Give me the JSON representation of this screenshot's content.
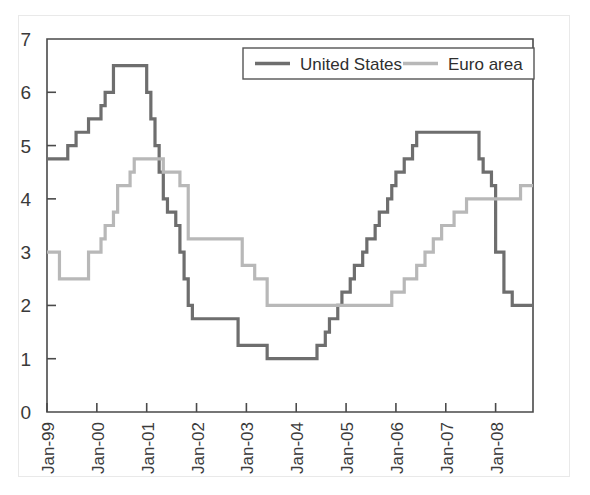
{
  "figure": {
    "title": "",
    "background_color": "#ffffff",
    "frame_color": "#e9e9e9"
  },
  "legend": {
    "position": "top-center-right",
    "entries": [
      {
        "label": "United States",
        "color": "#6e6e6e",
        "swatch_name": "legend-swatch-united-states"
      },
      {
        "label": "Euro area",
        "color": "#b8b8b8",
        "swatch_name": "legend-swatch-euro-area"
      }
    ]
  },
  "axes": {
    "y_ticks": [
      "0",
      "1",
      "2",
      "3",
      "4",
      "5",
      "6",
      "7"
    ],
    "x_ticks": [
      "Jan-99",
      "Jan-00",
      "Jan-01",
      "Jan-02",
      "Jan-03",
      "Jan-04",
      "Jan-05",
      "Jan-06",
      "Jan-07",
      "Jan-08"
    ]
  },
  "chart_data": {
    "type": "line",
    "title": "",
    "subtitle": "",
    "xlabel": "",
    "ylabel": "",
    "xlim": [
      "Jan-99",
      "Oct-08"
    ],
    "ylim": [
      0,
      7
    ],
    "y_ticks": [
      0,
      1,
      2,
      3,
      4,
      5,
      6,
      7
    ],
    "x_tick_labels": [
      "Jan-99",
      "Jan-00",
      "Jan-01",
      "Jan-02",
      "Jan-03",
      "Jan-04",
      "Jan-05",
      "Jan-06",
      "Jan-07",
      "Jan-08"
    ],
    "grid": false,
    "legend_position": "top-center-right",
    "line_style": "step",
    "x_months": [
      "Jan-99",
      "Feb-99",
      "Mar-99",
      "Apr-99",
      "May-99",
      "Jun-99",
      "Jul-99",
      "Aug-99",
      "Sep-99",
      "Oct-99",
      "Nov-99",
      "Dec-99",
      "Jan-00",
      "Feb-00",
      "Mar-00",
      "Apr-00",
      "May-00",
      "Jun-00",
      "Jul-00",
      "Aug-00",
      "Sep-00",
      "Oct-00",
      "Nov-00",
      "Dec-00",
      "Jan-01",
      "Feb-01",
      "Mar-01",
      "Apr-01",
      "May-01",
      "Jun-01",
      "Jul-01",
      "Aug-01",
      "Sep-01",
      "Oct-01",
      "Nov-01",
      "Dec-01",
      "Jan-02",
      "Feb-02",
      "Mar-02",
      "Apr-02",
      "May-02",
      "Jun-02",
      "Jul-02",
      "Aug-02",
      "Sep-02",
      "Oct-02",
      "Nov-02",
      "Dec-02",
      "Jan-03",
      "Feb-03",
      "Mar-03",
      "Apr-03",
      "May-03",
      "Jun-03",
      "Jul-03",
      "Aug-03",
      "Sep-03",
      "Oct-03",
      "Nov-03",
      "Dec-03",
      "Jan-04",
      "Feb-04",
      "Mar-04",
      "Apr-04",
      "May-04",
      "Jun-04",
      "Jul-04",
      "Aug-04",
      "Sep-04",
      "Oct-04",
      "Nov-04",
      "Dec-04",
      "Jan-05",
      "Feb-05",
      "Mar-05",
      "Apr-05",
      "May-05",
      "Jun-05",
      "Jul-05",
      "Aug-05",
      "Sep-05",
      "Oct-05",
      "Nov-05",
      "Dec-05",
      "Jan-06",
      "Feb-06",
      "Mar-06",
      "Apr-06",
      "May-06",
      "Jun-06",
      "Jul-06",
      "Aug-06",
      "Sep-06",
      "Oct-06",
      "Nov-06",
      "Dec-06",
      "Jan-07",
      "Feb-07",
      "Mar-07",
      "Apr-07",
      "May-07",
      "Jun-07",
      "Jul-07",
      "Aug-07",
      "Sep-07",
      "Oct-07",
      "Nov-07",
      "Dec-07",
      "Jan-08",
      "Feb-08",
      "Mar-08",
      "Apr-08",
      "May-08",
      "Jun-08",
      "Jul-08",
      "Aug-08",
      "Sep-08",
      "Oct-08"
    ],
    "series": [
      {
        "name": "United States",
        "color": "#6e6e6e",
        "line_width": 3.2,
        "values": [
          4.75,
          4.75,
          4.75,
          4.75,
          4.75,
          5.0,
          5.0,
          5.25,
          5.25,
          5.25,
          5.5,
          5.5,
          5.5,
          5.75,
          6.0,
          6.0,
          6.5,
          6.5,
          6.5,
          6.5,
          6.5,
          6.5,
          6.5,
          6.5,
          6.0,
          5.5,
          5.0,
          4.5,
          4.0,
          3.75,
          3.75,
          3.5,
          3.0,
          2.5,
          2.0,
          1.75,
          1.75,
          1.75,
          1.75,
          1.75,
          1.75,
          1.75,
          1.75,
          1.75,
          1.75,
          1.75,
          1.25,
          1.25,
          1.25,
          1.25,
          1.25,
          1.25,
          1.25,
          1.0,
          1.0,
          1.0,
          1.0,
          1.0,
          1.0,
          1.0,
          1.0,
          1.0,
          1.0,
          1.0,
          1.0,
          1.25,
          1.25,
          1.5,
          1.75,
          1.75,
          2.0,
          2.25,
          2.25,
          2.5,
          2.75,
          2.75,
          3.0,
          3.25,
          3.25,
          3.5,
          3.75,
          3.75,
          4.0,
          4.25,
          4.5,
          4.5,
          4.75,
          4.75,
          5.0,
          5.25,
          5.25,
          5.25,
          5.25,
          5.25,
          5.25,
          5.25,
          5.25,
          5.25,
          5.25,
          5.25,
          5.25,
          5.25,
          5.25,
          5.25,
          4.75,
          4.5,
          4.5,
          4.25,
          3.0,
          3.0,
          2.25,
          2.25,
          2.0,
          2.0,
          2.0,
          2.0,
          2.0,
          2.0
        ]
      },
      {
        "name": "Euro area",
        "color": "#b8b8b8",
        "line_width": 3.2,
        "values": [
          3.0,
          3.0,
          3.0,
          2.5,
          2.5,
          2.5,
          2.5,
          2.5,
          2.5,
          2.5,
          3.0,
          3.0,
          3.0,
          3.25,
          3.5,
          3.5,
          3.75,
          4.25,
          4.25,
          4.25,
          4.5,
          4.75,
          4.75,
          4.75,
          4.75,
          4.75,
          4.75,
          4.75,
          4.5,
          4.5,
          4.5,
          4.5,
          4.25,
          4.25,
          3.25,
          3.25,
          3.25,
          3.25,
          3.25,
          3.25,
          3.25,
          3.25,
          3.25,
          3.25,
          3.25,
          3.25,
          3.25,
          2.75,
          2.75,
          2.75,
          2.5,
          2.5,
          2.5,
          2.0,
          2.0,
          2.0,
          2.0,
          2.0,
          2.0,
          2.0,
          2.0,
          2.0,
          2.0,
          2.0,
          2.0,
          2.0,
          2.0,
          2.0,
          2.0,
          2.0,
          2.0,
          2.0,
          2.0,
          2.0,
          2.0,
          2.0,
          2.0,
          2.0,
          2.0,
          2.0,
          2.0,
          2.0,
          2.0,
          2.25,
          2.25,
          2.25,
          2.5,
          2.5,
          2.5,
          2.75,
          2.75,
          3.0,
          3.0,
          3.25,
          3.25,
          3.5,
          3.5,
          3.5,
          3.75,
          3.75,
          3.75,
          4.0,
          4.0,
          4.0,
          4.0,
          4.0,
          4.0,
          4.0,
          4.0,
          4.0,
          4.0,
          4.0,
          4.0,
          4.0,
          4.25,
          4.25,
          4.25,
          4.25
        ]
      }
    ]
  }
}
